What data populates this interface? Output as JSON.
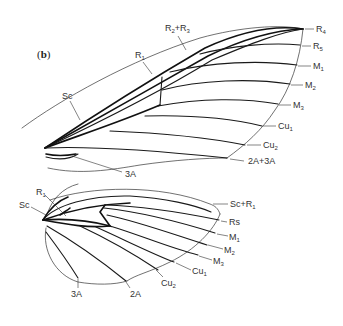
{
  "figure": {
    "panel_label_open": "(",
    "panel_label_letter": "b",
    "panel_label_close": ")",
    "forewing": {
      "labels": {
        "R2R3": "R",
        "R2R3_sub1": "2",
        "R2R3_plus": "+R",
        "R2R3_sub2": "3",
        "R1": "R",
        "R1_sub": "1",
        "Sc": "Sc",
        "R4": "R",
        "R4_sub": "4",
        "R5": "R",
        "R5_sub": "5",
        "M1": "M",
        "M1_sub": "1",
        "M2": "M",
        "M2_sub": "2",
        "M3": "M",
        "M3_sub": "3",
        "Cu1": "Cu",
        "Cu1_sub": "1",
        "Cu2": "Cu",
        "Cu2_sub": "2",
        "A2A3": "2A+3A",
        "A3": "3A"
      }
    },
    "hindwing": {
      "labels": {
        "R1": "R",
        "R1_sub": "1",
        "Sc": "Sc",
        "ScR1": "Sc+R",
        "ScR1_sub": "1",
        "Rs": "Rs",
        "M1": "M",
        "M1_sub": "1",
        "M2": "M",
        "M2_sub": "2",
        "M3": "M",
        "M3_sub": "3",
        "Cu1": "Cu",
        "Cu1_sub": "1",
        "Cu2": "Cu",
        "Cu2_sub": "2",
        "A3": "3A",
        "A2": "2A"
      }
    }
  }
}
